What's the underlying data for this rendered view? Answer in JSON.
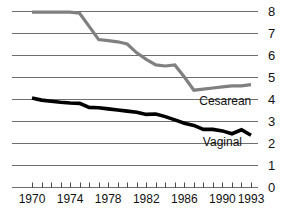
{
  "chart_data": {
    "type": "line",
    "title": "",
    "subtitle": "",
    "xlabel": "",
    "ylabel": "",
    "grid": true,
    "legend_position": "inline-right",
    "xlim": [
      1970,
      1993
    ],
    "ylim": [
      0,
      8
    ],
    "yticks": [
      "8",
      "7",
      "6",
      "5",
      "4",
      "3",
      "2",
      "1",
      "0"
    ],
    "ytick_values": [
      8,
      7,
      6,
      5,
      4,
      3,
      2,
      1,
      0
    ],
    "xticks_labeled": [
      "1970",
      "1974",
      "1978",
      "1982",
      "1986",
      "1990",
      "1993"
    ],
    "xtick_values": [
      1970,
      1971,
      1972,
      1973,
      1974,
      1975,
      1976,
      1977,
      1978,
      1979,
      1980,
      1981,
      1982,
      1983,
      1984,
      1985,
      1986,
      1987,
      1988,
      1989,
      1990,
      1991,
      1992,
      1993
    ],
    "x": [
      1970,
      1971,
      1972,
      1973,
      1974,
      1975,
      1976,
      1977,
      1978,
      1979,
      1980,
      1981,
      1982,
      1983,
      1984,
      1985,
      1986,
      1987,
      1988,
      1989,
      1990,
      1991,
      1992,
      1993
    ],
    "series": [
      {
        "name": "Cesarean",
        "color": "#808080",
        "values": [
          7.95,
          7.95,
          7.95,
          7.95,
          7.95,
          7.9,
          7.3,
          6.7,
          6.65,
          6.6,
          6.5,
          6.1,
          5.8,
          5.55,
          5.5,
          5.55,
          5.0,
          4.4,
          4.45,
          4.5,
          4.55,
          4.6,
          4.6,
          4.65
        ]
      },
      {
        "name": "Vaginal",
        "color": "#000000",
        "values": [
          4.05,
          3.95,
          3.9,
          3.85,
          3.82,
          3.8,
          3.62,
          3.6,
          3.55,
          3.5,
          3.45,
          3.4,
          3.3,
          3.32,
          3.2,
          3.05,
          2.9,
          2.8,
          2.62,
          2.62,
          2.55,
          2.42,
          2.6,
          2.35
        ]
      }
    ],
    "annotations": [
      {
        "text": "Cesarean",
        "x": 1990.3,
        "y": 3.72
      },
      {
        "text": "Vaginal",
        "x": 1990.0,
        "y": 1.85
      }
    ]
  }
}
